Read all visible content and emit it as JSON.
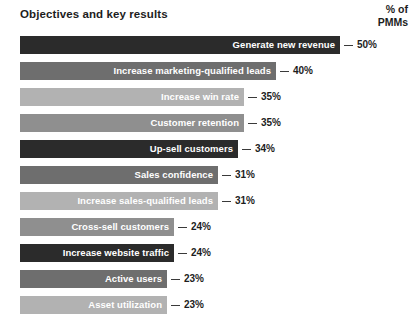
{
  "header": {
    "title": "Objectives and key results",
    "value_header_line1": "% of",
    "value_header_line2": "PMMs"
  },
  "chart_data": {
    "type": "bar",
    "orientation": "horizontal",
    "title": "Objectives and key results",
    "xlabel": "",
    "ylabel": "",
    "value_axis_label": "% of PMMs",
    "value_suffix": "%",
    "grid": false,
    "legend": false,
    "xlim": [
      0,
      50
    ],
    "categories": [
      "Generate new revenue",
      "Increase marketing-qualified leads",
      "Increase win rate",
      "Customer retention",
      "Up-sell customers",
      "Sales confidence",
      "Increase sales-qualified leads",
      "Cross-sell customers",
      "Increase website traffic",
      "Active users",
      "Asset utilization"
    ],
    "values": [
      50,
      40,
      35,
      35,
      34,
      31,
      31,
      24,
      24,
      23,
      23
    ],
    "value_labels": [
      "50%",
      "40%",
      "35%",
      "35%",
      "34%",
      "31%",
      "31%",
      "24%",
      "24%",
      "23%",
      "23%"
    ],
    "bar_colors": [
      "#2b2b2b",
      "#6e6e6e",
      "#b2b2b2",
      "#8f8f8f",
      "#2b2b2b",
      "#6e6e6e",
      "#b2b2b2",
      "#8f8f8f",
      "#2b2b2b",
      "#6e6e6e",
      "#b2b2b2"
    ]
  },
  "colors": {
    "background": "#ffffff",
    "text": "#1d1d1d",
    "bar_label": "#ffffff",
    "leader_line": "#3a3a3a"
  }
}
